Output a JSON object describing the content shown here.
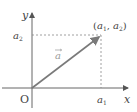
{
  "diagram": {
    "type": "vector-coordinate-diagram",
    "axes": {
      "x_label": "x",
      "y_label": "y",
      "origin_label": "O"
    },
    "vector": {
      "label": "a",
      "has_arrow_over_label": true,
      "from": "O",
      "to_label": "(a1, a2)"
    },
    "point_label": {
      "open": "(",
      "a": "a",
      "sub1": "1",
      "comma": ", ",
      "sub2": "2",
      "close": ")"
    },
    "tick_labels": {
      "x_tick": {
        "base": "a",
        "sub": "1"
      },
      "y_tick": {
        "base": "a",
        "sub": "2"
      }
    },
    "colors": {
      "axis": "#666666",
      "vector": "#7a7a7a",
      "dashed": "#888888",
      "text": "#444444",
      "vector_label": "#9a9a9a"
    }
  }
}
